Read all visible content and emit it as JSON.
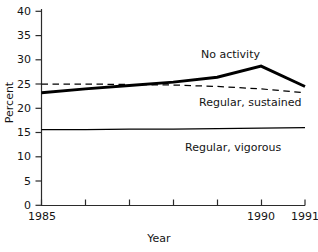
{
  "chart_data": {
    "type": "line",
    "title": "",
    "xlabel": "Year",
    "ylabel": "Percent",
    "x": [
      1985,
      1986,
      1987,
      1988,
      1989,
      1990,
      1991
    ],
    "xlim": [
      1985,
      1991
    ],
    "ylim": [
      0,
      40
    ],
    "yticks": [
      0,
      5,
      10,
      15,
      20,
      25,
      30,
      35,
      40
    ],
    "xticks": [
      1985,
      1986,
      1987,
      1988,
      1989,
      1990,
      1991
    ],
    "xtick_labels_shown": [
      "1985",
      "1990",
      "1991"
    ],
    "grid": false,
    "legend": "inline annotations next to each line",
    "series": [
      {
        "name": "No activity",
        "style": "solid-bold",
        "values": [
          23.2,
          24.0,
          24.7,
          25.4,
          26.4,
          28.7,
          24.5
        ]
      },
      {
        "name": "Regular, sustained",
        "style": "dashed",
        "values": [
          25.0,
          25.0,
          24.9,
          24.8,
          24.5,
          24.0,
          23.2
        ]
      },
      {
        "name": "Regular, vigorous",
        "style": "solid-thin",
        "values": [
          15.6,
          15.6,
          15.7,
          15.7,
          15.8,
          15.9,
          16.0
        ]
      }
    ]
  },
  "axes": {
    "ytick_labels": [
      "40",
      "35",
      "30",
      "25",
      "20",
      "15",
      "10",
      "5",
      "0"
    ],
    "xtick_labels": [
      "1985",
      "1990",
      "1991"
    ],
    "y_axis_title": "Percent",
    "x_axis_title": "Year"
  },
  "annotations": {
    "no_activity": "No activity",
    "regular_sustained": "Regular, sustained",
    "regular_vigorous": "Regular, vigorous"
  },
  "colors": {
    "line": "#000000",
    "axis": "#2b2b2b",
    "text": "#141414",
    "background": "#ffffff"
  }
}
